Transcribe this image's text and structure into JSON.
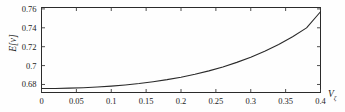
{
  "chart_data": {
    "type": "line",
    "title": "",
    "subtitle": "",
    "xlabel": "V",
    "xlabel_sub": "ζ",
    "ylabel": "E[ν]",
    "xlim": [
      0,
      0.4
    ],
    "ylim": [
      0.6715,
      0.7615
    ],
    "grid": false,
    "legend": null,
    "xticks": [
      0,
      0.05,
      0.1,
      0.15,
      0.2,
      0.25,
      0.3,
      0.35,
      0.4
    ],
    "xticklabels": [
      "0",
      "0.05",
      "0.1",
      "0.15",
      "0.2",
      "0.25",
      "0.3",
      "0.35",
      "0.4"
    ],
    "yticks": [
      0.68,
      0.7,
      0.72,
      0.74,
      0.76
    ],
    "yticklabels": [
      "0.68",
      "0.7",
      "0.72",
      "0.74",
      "0.76"
    ],
    "series": [
      {
        "name": "E[ν] vs Vζ",
        "color": "#2a2a2a",
        "x": [
          0,
          0.02,
          0.04,
          0.06,
          0.08,
          0.1,
          0.12,
          0.14,
          0.16,
          0.18,
          0.2,
          0.22,
          0.24,
          0.26,
          0.28,
          0.3,
          0.32,
          0.34,
          0.36,
          0.38,
          0.4
        ],
        "y": [
          0.6757,
          0.6758,
          0.6761,
          0.6766,
          0.6773,
          0.6783,
          0.6795,
          0.681,
          0.6829,
          0.6851,
          0.6877,
          0.6908,
          0.6944,
          0.6986,
          0.7034,
          0.7089,
          0.7152,
          0.7224,
          0.7306,
          0.7399,
          0.757
        ]
      }
    ]
  },
  "axes": {
    "tick_direction": "in",
    "frame": "box"
  }
}
